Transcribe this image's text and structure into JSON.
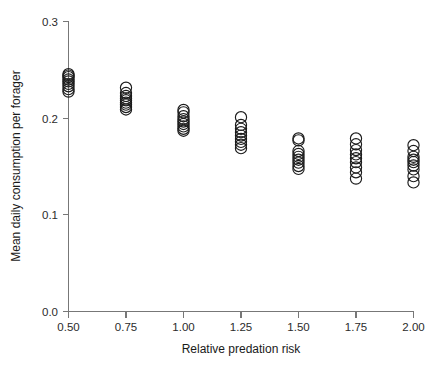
{
  "chart_data": {
    "type": "scatter",
    "title": "",
    "xlabel": "Relative predation risk",
    "ylabel": "Mean daily consumption per forager",
    "xlim": [
      0.4375,
      2.0625
    ],
    "ylim": [
      0.0,
      0.3
    ],
    "grid": false,
    "legend": null,
    "marker": "open-circle",
    "xticks": [
      0.5,
      1.0,
      1.5,
      2.0
    ],
    "xtick_labels": [
      "0.50",
      "0.75",
      "1.00",
      "1.25",
      "1.50",
      "1.75",
      "2.00"
    ],
    "xtick_values": [
      0.5,
      0.75,
      1.0,
      1.25,
      1.5,
      1.75,
      2.0
    ],
    "ytick_labels": [
      "0.0",
      "0.1",
      "0.2",
      "0.3"
    ],
    "ytick_values": [
      0.0,
      0.1,
      0.2,
      0.3
    ],
    "series": [
      {
        "name": "Mean daily consumption per forager",
        "points": [
          {
            "x": 0.5,
            "y": 0.2455
          },
          {
            "x": 0.5,
            "y": 0.244
          },
          {
            "x": 0.5,
            "y": 0.2425
          },
          {
            "x": 0.5,
            "y": 0.24
          },
          {
            "x": 0.5,
            "y": 0.238
          },
          {
            "x": 0.5,
            "y": 0.2355
          },
          {
            "x": 0.5,
            "y": 0.233
          },
          {
            "x": 0.5,
            "y": 0.23
          },
          {
            "x": 0.5,
            "y": 0.2275
          },
          {
            "x": 0.75,
            "y": 0.2315
          },
          {
            "x": 0.75,
            "y": 0.226
          },
          {
            "x": 0.75,
            "y": 0.223
          },
          {
            "x": 0.75,
            "y": 0.2205
          },
          {
            "x": 0.75,
            "y": 0.2185
          },
          {
            "x": 0.75,
            "y": 0.216
          },
          {
            "x": 0.75,
            "y": 0.214
          },
          {
            "x": 0.75,
            "y": 0.2115
          },
          {
            "x": 0.75,
            "y": 0.209
          },
          {
            "x": 1.0,
            "y": 0.2085
          },
          {
            "x": 1.0,
            "y": 0.206
          },
          {
            "x": 1.0,
            "y": 0.202
          },
          {
            "x": 1.0,
            "y": 0.199
          },
          {
            "x": 1.0,
            "y": 0.1965
          },
          {
            "x": 1.0,
            "y": 0.194
          },
          {
            "x": 1.0,
            "y": 0.1915
          },
          {
            "x": 1.0,
            "y": 0.189
          },
          {
            "x": 1.0,
            "y": 0.187
          },
          {
            "x": 1.25,
            "y": 0.201
          },
          {
            "x": 1.25,
            "y": 0.193
          },
          {
            "x": 1.25,
            "y": 0.189
          },
          {
            "x": 1.25,
            "y": 0.1855
          },
          {
            "x": 1.25,
            "y": 0.182
          },
          {
            "x": 1.25,
            "y": 0.1785
          },
          {
            "x": 1.25,
            "y": 0.1755
          },
          {
            "x": 1.25,
            "y": 0.1725
          },
          {
            "x": 1.25,
            "y": 0.169
          },
          {
            "x": 1.5,
            "y": 0.179
          },
          {
            "x": 1.5,
            "y": 0.177
          },
          {
            "x": 1.5,
            "y": 0.166
          },
          {
            "x": 1.5,
            "y": 0.163
          },
          {
            "x": 1.5,
            "y": 0.16
          },
          {
            "x": 1.5,
            "y": 0.157
          },
          {
            "x": 1.5,
            "y": 0.154
          },
          {
            "x": 1.5,
            "y": 0.1505
          },
          {
            "x": 1.5,
            "y": 0.1475
          },
          {
            "x": 1.75,
            "y": 0.179
          },
          {
            "x": 1.75,
            "y": 0.173
          },
          {
            "x": 1.75,
            "y": 0.167
          },
          {
            "x": 1.75,
            "y": 0.1625
          },
          {
            "x": 1.75,
            "y": 0.1585
          },
          {
            "x": 1.75,
            "y": 0.1545
          },
          {
            "x": 1.75,
            "y": 0.149
          },
          {
            "x": 1.75,
            "y": 0.144
          },
          {
            "x": 1.75,
            "y": 0.1375
          },
          {
            "x": 2.0,
            "y": 0.172
          },
          {
            "x": 2.0,
            "y": 0.166
          },
          {
            "x": 2.0,
            "y": 0.16
          },
          {
            "x": 2.0,
            "y": 0.157
          },
          {
            "x": 2.0,
            "y": 0.1545
          },
          {
            "x": 2.0,
            "y": 0.151
          },
          {
            "x": 2.0,
            "y": 0.147
          },
          {
            "x": 2.0,
            "y": 0.14
          },
          {
            "x": 2.0,
            "y": 0.1335
          }
        ]
      }
    ]
  }
}
